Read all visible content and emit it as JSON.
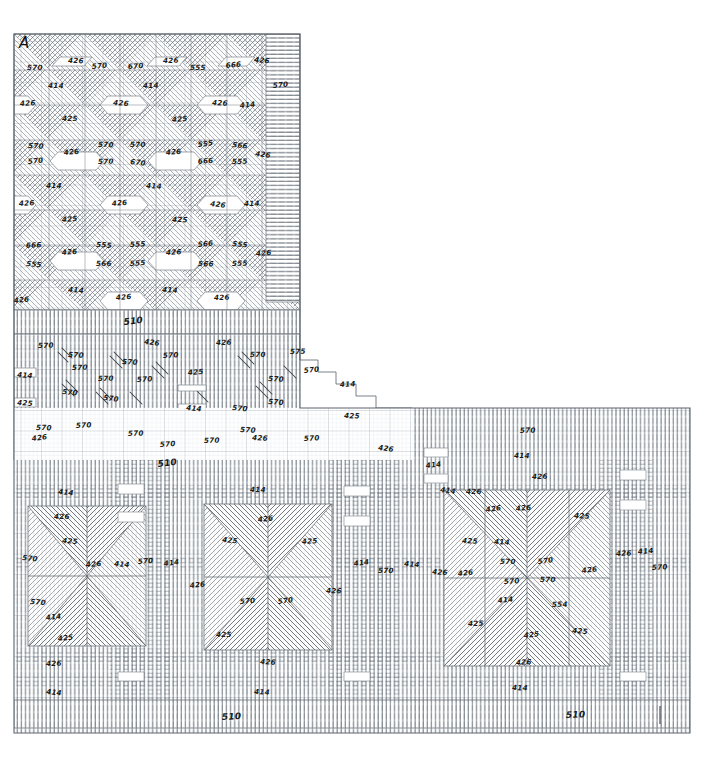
{
  "document": {
    "kind": "hand-drawn-graph-paper-draft",
    "plate_label": "A",
    "paper_color": "#ffffff",
    "grid_minor_color": "#c9cfd6",
    "grid_major_color": "#9aa4ae",
    "ink_color": "#2b2b2b",
    "annotation_color": "#1a1a1a",
    "outline_color": "#5c646c",
    "width": 708,
    "height": 773
  },
  "layout": {
    "blocks": [
      {
        "name": "upper-left-block",
        "x": 14,
        "y": 34,
        "w": 286,
        "h": 276
      },
      {
        "name": "middle-band",
        "x": 14,
        "y": 310,
        "w": 398,
        "h": 150
      },
      {
        "name": "lower-block",
        "x": 14,
        "y": 408,
        "w": 676,
        "h": 325
      }
    ],
    "border_bands": [
      {
        "name": "upper-right-border-band",
        "orientation": "horizontal-hatch",
        "label": "570"
      },
      {
        "name": "mid-divider-band",
        "orientation": "vertical-hatch",
        "label": "510"
      },
      {
        "name": "bottom-border-band",
        "orientation": "vertical-hatch",
        "labels": [
          "510",
          "510"
        ]
      }
    ]
  },
  "motifs": {
    "upper_block": "diagonal cross-hatch lattice with hexagon/diamond reserves",
    "middle_band": "vertical warp ground with scattered short diagonal strokes",
    "lower_left_medallion": "eight-point star / snowflake, radiating diagonal hatch",
    "lower_right_medallion": "eight-point star / snowflake, radiating diagonal hatch"
  },
  "annotations": {
    "plate": {
      "text": "A",
      "x": 19,
      "y": 48
    },
    "upper_block": [
      {
        "t": "570",
        "x": 27,
        "y": 70
      },
      {
        "t": "426",
        "x": 68,
        "y": 63
      },
      {
        "t": "570",
        "x": 92,
        "y": 69
      },
      {
        "t": "670",
        "x": 128,
        "y": 69
      },
      {
        "t": "426",
        "x": 163,
        "y": 63
      },
      {
        "t": "555",
        "x": 190,
        "y": 70
      },
      {
        "t": "666",
        "x": 226,
        "y": 68
      },
      {
        "t": "426",
        "x": 254,
        "y": 62
      },
      {
        "t": "414",
        "x": 48,
        "y": 88
      },
      {
        "t": "414",
        "x": 143,
        "y": 88
      },
      {
        "t": "426",
        "x": 20,
        "y": 106
      },
      {
        "t": "426",
        "x": 113,
        "y": 105
      },
      {
        "t": "426",
        "x": 212,
        "y": 105
      },
      {
        "t": "414",
        "x": 240,
        "y": 108
      },
      {
        "t": "425",
        "x": 62,
        "y": 121
      },
      {
        "t": "425",
        "x": 172,
        "y": 122
      },
      {
        "t": "570",
        "x": 28,
        "y": 148
      },
      {
        "t": "426",
        "x": 64,
        "y": 155
      },
      {
        "t": "570",
        "x": 98,
        "y": 147
      },
      {
        "t": "570",
        "x": 130,
        "y": 147
      },
      {
        "t": "426",
        "x": 166,
        "y": 155
      },
      {
        "t": "555",
        "x": 198,
        "y": 147
      },
      {
        "t": "566",
        "x": 232,
        "y": 147
      },
      {
        "t": "426",
        "x": 255,
        "y": 156
      },
      {
        "t": "570",
        "x": 28,
        "y": 164
      },
      {
        "t": "570",
        "x": 98,
        "y": 164
      },
      {
        "t": "670",
        "x": 130,
        "y": 164
      },
      {
        "t": "666",
        "x": 198,
        "y": 164
      },
      {
        "t": "555",
        "x": 232,
        "y": 164
      },
      {
        "t": "414",
        "x": 46,
        "y": 188
      },
      {
        "t": "414",
        "x": 146,
        "y": 188
      },
      {
        "t": "426",
        "x": 19,
        "y": 206
      },
      {
        "t": "426",
        "x": 112,
        "y": 206
      },
      {
        "t": "426",
        "x": 210,
        "y": 206
      },
      {
        "t": "414",
        "x": 244,
        "y": 206
      },
      {
        "t": "425",
        "x": 62,
        "y": 222
      },
      {
        "t": "425",
        "x": 172,
        "y": 222
      },
      {
        "t": "666",
        "x": 26,
        "y": 248
      },
      {
        "t": "426",
        "x": 62,
        "y": 255
      },
      {
        "t": "555",
        "x": 96,
        "y": 247
      },
      {
        "t": "555",
        "x": 130,
        "y": 247
      },
      {
        "t": "426",
        "x": 166,
        "y": 255
      },
      {
        "t": "566",
        "x": 198,
        "y": 247
      },
      {
        "t": "555",
        "x": 232,
        "y": 246
      },
      {
        "t": "426",
        "x": 256,
        "y": 256
      },
      {
        "t": "555",
        "x": 26,
        "y": 266
      },
      {
        "t": "566",
        "x": 96,
        "y": 266
      },
      {
        "t": "555",
        "x": 130,
        "y": 266
      },
      {
        "t": "566",
        "x": 198,
        "y": 266
      },
      {
        "t": "555",
        "x": 232,
        "y": 266
      },
      {
        "t": "414",
        "x": 68,
        "y": 292
      },
      {
        "t": "414",
        "x": 162,
        "y": 292
      },
      {
        "t": "426",
        "x": 14,
        "y": 303
      },
      {
        "t": "426",
        "x": 116,
        "y": 300
      },
      {
        "t": "426",
        "x": 214,
        "y": 300
      },
      {
        "t": "570",
        "x": 273,
        "y": 88
      }
    ],
    "middle_band": [
      {
        "t": "510",
        "x": 124,
        "y": 325,
        "big": true
      },
      {
        "t": "570",
        "x": 38,
        "y": 348
      },
      {
        "t": "570",
        "x": 68,
        "y": 357
      },
      {
        "t": "570",
        "x": 122,
        "y": 364
      },
      {
        "t": "426",
        "x": 144,
        "y": 344
      },
      {
        "t": "570",
        "x": 163,
        "y": 358
      },
      {
        "t": "426",
        "x": 216,
        "y": 345
      },
      {
        "t": "570",
        "x": 250,
        "y": 357
      },
      {
        "t": "575",
        "x": 290,
        "y": 354
      },
      {
        "t": "414",
        "x": 17,
        "y": 377
      },
      {
        "t": "570",
        "x": 72,
        "y": 370
      },
      {
        "t": "570",
        "x": 98,
        "y": 381
      },
      {
        "t": "570",
        "x": 137,
        "y": 382
      },
      {
        "t": "425",
        "x": 188,
        "y": 375
      },
      {
        "t": "570",
        "x": 268,
        "y": 381
      },
      {
        "t": "570",
        "x": 304,
        "y": 373
      },
      {
        "t": "414",
        "x": 340,
        "y": 387
      },
      {
        "t": "425",
        "x": 17,
        "y": 405
      },
      {
        "t": "570",
        "x": 62,
        "y": 394
      },
      {
        "t": "570",
        "x": 103,
        "y": 400
      },
      {
        "t": "414",
        "x": 186,
        "y": 410
      },
      {
        "t": "570",
        "x": 232,
        "y": 410
      },
      {
        "t": "570",
        "x": 268,
        "y": 404
      },
      {
        "t": "425",
        "x": 344,
        "y": 418
      },
      {
        "t": "570",
        "x": 36,
        "y": 430
      },
      {
        "t": "426",
        "x": 32,
        "y": 441
      },
      {
        "t": "570",
        "x": 76,
        "y": 428
      },
      {
        "t": "570",
        "x": 128,
        "y": 436
      },
      {
        "t": "570",
        "x": 160,
        "y": 447
      },
      {
        "t": "570",
        "x": 204,
        "y": 443
      },
      {
        "t": "570",
        "x": 240,
        "y": 432
      },
      {
        "t": "426",
        "x": 252,
        "y": 440
      },
      {
        "t": "570",
        "x": 304,
        "y": 441
      },
      {
        "t": "426",
        "x": 378,
        "y": 450
      },
      {
        "t": "510",
        "x": 158,
        "y": 467,
        "big": true
      }
    ],
    "lower_block": [
      {
        "t": "570",
        "x": 520,
        "y": 433
      },
      {
        "t": "414",
        "x": 514,
        "y": 458
      },
      {
        "t": "426",
        "x": 532,
        "y": 479
      },
      {
        "t": "414",
        "x": 426,
        "y": 468
      },
      {
        "t": "414",
        "x": 440,
        "y": 492
      },
      {
        "t": "426",
        "x": 466,
        "y": 494
      },
      {
        "t": "414",
        "x": 58,
        "y": 494
      },
      {
        "t": "414",
        "x": 250,
        "y": 492
      },
      {
        "t": "426",
        "x": 54,
        "y": 519
      },
      {
        "t": "426",
        "x": 258,
        "y": 522
      },
      {
        "t": "425",
        "x": 62,
        "y": 543
      },
      {
        "t": "425",
        "x": 222,
        "y": 542
      },
      {
        "t": "425",
        "x": 302,
        "y": 544
      },
      {
        "t": "426",
        "x": 486,
        "y": 512
      },
      {
        "t": "426",
        "x": 516,
        "y": 511
      },
      {
        "t": "425",
        "x": 574,
        "y": 518
      },
      {
        "t": "425",
        "x": 462,
        "y": 543
      },
      {
        "t": "414",
        "x": 494,
        "y": 544
      },
      {
        "t": "570",
        "x": 22,
        "y": 560
      },
      {
        "t": "426",
        "x": 86,
        "y": 567
      },
      {
        "t": "414",
        "x": 114,
        "y": 566
      },
      {
        "t": "570",
        "x": 138,
        "y": 564
      },
      {
        "t": "414",
        "x": 164,
        "y": 566
      },
      {
        "t": "426",
        "x": 190,
        "y": 588
      },
      {
        "t": "414",
        "x": 354,
        "y": 566
      },
      {
        "t": "570",
        "x": 378,
        "y": 573
      },
      {
        "t": "414",
        "x": 404,
        "y": 566
      },
      {
        "t": "426",
        "x": 432,
        "y": 574
      },
      {
        "t": "426",
        "x": 458,
        "y": 576
      },
      {
        "t": "570",
        "x": 500,
        "y": 564
      },
      {
        "t": "570",
        "x": 538,
        "y": 564
      },
      {
        "t": "570",
        "x": 504,
        "y": 584
      },
      {
        "t": "570",
        "x": 540,
        "y": 582
      },
      {
        "t": "426",
        "x": 582,
        "y": 573
      },
      {
        "t": "426",
        "x": 616,
        "y": 556
      },
      {
        "t": "414",
        "x": 638,
        "y": 554
      },
      {
        "t": "570",
        "x": 652,
        "y": 570
      },
      {
        "t": "570",
        "x": 30,
        "y": 604
      },
      {
        "t": "414",
        "x": 46,
        "y": 620
      },
      {
        "t": "570",
        "x": 240,
        "y": 604
      },
      {
        "t": "570",
        "x": 278,
        "y": 604
      },
      {
        "t": "426",
        "x": 326,
        "y": 593
      },
      {
        "t": "414",
        "x": 498,
        "y": 603
      },
      {
        "t": "554",
        "x": 552,
        "y": 607
      },
      {
        "t": "425",
        "x": 58,
        "y": 641
      },
      {
        "t": "425",
        "x": 216,
        "y": 637
      },
      {
        "t": "425",
        "x": 468,
        "y": 626
      },
      {
        "t": "425",
        "x": 524,
        "y": 638
      },
      {
        "t": "425",
        "x": 572,
        "y": 633
      },
      {
        "t": "426",
        "x": 46,
        "y": 666
      },
      {
        "t": "426",
        "x": 260,
        "y": 664
      },
      {
        "t": "426",
        "x": 516,
        "y": 665
      },
      {
        "t": "414",
        "x": 46,
        "y": 694
      },
      {
        "t": "414",
        "x": 254,
        "y": 694
      },
      {
        "t": "414",
        "x": 512,
        "y": 690
      },
      {
        "t": "510",
        "x": 222,
        "y": 720,
        "big": true
      },
      {
        "t": "510",
        "x": 566,
        "y": 718,
        "big": true
      }
    ]
  },
  "legend": {
    "codes": [
      "570",
      "426",
      "414",
      "425",
      "510",
      "555",
      "566",
      "666",
      "575",
      "554",
      "670"
    ],
    "note": "handwritten yarn / thread reference numbers"
  }
}
